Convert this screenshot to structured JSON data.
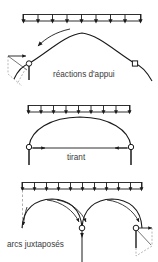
{
  "figure": {
    "title_visible": false,
    "background_color": "#ffffff",
    "line_color": "#1a1a1a",
    "text_color": "#3a3a3a",
    "width": 158,
    "height": 262
  },
  "panels": [
    {
      "id": "panel-1",
      "caption": "réactions d'appui",
      "caption_x": 53,
      "caption_y": 74,
      "load_bar": {
        "x1": 23,
        "x2": 141,
        "y_top": 14,
        "y_bottom": 21,
        "arrow_count": 9,
        "arrow_direction": "down"
      },
      "arch": {
        "type": "parabolic-arc",
        "left_x": 29,
        "left_y": 64,
        "apex_x": 82,
        "apex_y": 33,
        "right_x": 135,
        "right_y": 64,
        "extends_beyond_supports": true
      },
      "supports": [
        {
          "name": "left-pin-support",
          "x": 29,
          "y": 64,
          "glyph": "circle",
          "has_force_polygon": true,
          "has_vertical_reaction": true,
          "has_horizontal_reaction": true
        },
        {
          "name": "right-roller-support",
          "x": 135,
          "y": 64,
          "glyph": "square",
          "has_force_polygon": false
        }
      ],
      "thrust_arrows": 1
    },
    {
      "id": "panel-2",
      "caption": "tirant",
      "caption_x": 67,
      "caption_y": 158,
      "load_bar": {
        "x1": 28,
        "x2": 130,
        "y_top": 105,
        "y_bottom": 112,
        "arrow_count": 9,
        "arrow_direction": "down"
      },
      "arch": {
        "type": "parabolic-arc",
        "left_x": 29,
        "left_y": 148,
        "apex_x": 80,
        "apex_y": 117,
        "right_x": 131,
        "right_y": 148
      },
      "tie": {
        "name": "tie-rod",
        "x1": 29,
        "x2": 131,
        "y": 148,
        "arrow_direction": "both-inward"
      },
      "supports": [
        {
          "name": "left-pin-support",
          "x": 29,
          "y": 148,
          "glyph": "circle",
          "has_vertical_reaction": true
        },
        {
          "name": "right-pin-support",
          "x": 131,
          "y": 148,
          "glyph": "circle",
          "has_vertical_reaction": true
        }
      ]
    },
    {
      "id": "panel-3",
      "caption": "arcs juxtaposés",
      "caption_x": 7,
      "caption_y": 245,
      "load_bar": {
        "x1": 22,
        "x2": 142,
        "y_top": 182,
        "y_bottom": 189,
        "arrow_count": 11,
        "arrow_direction": "down"
      },
      "arches": [
        {
          "name": "arch-left",
          "left_x": 22,
          "left_y": 228,
          "apex_x": 52,
          "apex_y": 200,
          "right_x": 82,
          "right_y": 228
        },
        {
          "name": "arch-right",
          "left_x": 82,
          "left_y": 228,
          "apex_x": 112,
          "apex_y": 200,
          "right_x": 142,
          "right_y": 228
        }
      ],
      "supports": [
        {
          "name": "center-pier-support",
          "x": 82,
          "y": 228,
          "glyph": "circle",
          "has_vertical_reaction": true,
          "pier_bottom_y": 262
        },
        {
          "name": "right-abutment-support",
          "x": 136,
          "y": 228,
          "glyph": "circle",
          "has_force_polygon": true,
          "has_horizontal_reaction": true,
          "has_vertical_reaction": true
        }
      ],
      "reference_line": {
        "name": "left-dashed-axis",
        "x": 22,
        "y1": 189,
        "y2": 230,
        "style": "dashed"
      },
      "thrust_arrows": 4
    }
  ]
}
